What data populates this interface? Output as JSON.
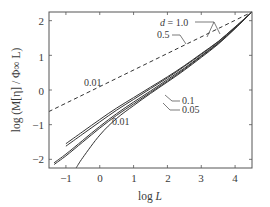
{
  "chart_data": {
    "type": "line",
    "title": "",
    "xlabel": "log L",
    "ylabel": "log (M[η] / Φ∞ L)",
    "xlim": [
      -1.5,
      4.5
    ],
    "ylim": [
      -2.25,
      2.25
    ],
    "xticks": [
      "-1",
      "0",
      "1",
      "2",
      "3",
      "4"
    ],
    "yticks": [
      "2",
      "1",
      "0",
      "-1",
      "-2"
    ],
    "grid": false,
    "legend": "inline annotations",
    "series": [
      {
        "name": "d = 1.0",
        "style": "solid",
        "x": [
          -1.0,
          -0.5,
          0,
          0.5,
          1,
          1.5,
          2,
          2.5,
          3,
          3.5,
          4,
          4.5
        ],
        "y": [
          -1.55,
          -1.2,
          -0.85,
          -0.52,
          -0.22,
          0.08,
          0.38,
          0.7,
          1.05,
          1.4,
          1.82,
          2.25
        ]
      },
      {
        "name": "0.5",
        "style": "solid",
        "x": [
          -1.0,
          -0.5,
          0,
          0.5,
          1,
          1.5,
          2,
          2.5,
          3,
          3.5,
          4,
          4.5
        ],
        "y": [
          -1.62,
          -1.27,
          -0.92,
          -0.58,
          -0.27,
          0.04,
          0.35,
          0.68,
          1.03,
          1.39,
          1.81,
          2.25
        ]
      },
      {
        "name": "0.1",
        "style": "solid",
        "x": [
          -1.35,
          -1,
          -0.5,
          0,
          0.5,
          1,
          1.5,
          2,
          2.5,
          3,
          3.5,
          4,
          4.5
        ],
        "y": [
          -2.1,
          -1.85,
          -1.45,
          -1.05,
          -0.68,
          -0.35,
          -0.03,
          0.3,
          0.63,
          0.99,
          1.36,
          1.79,
          2.25
        ]
      },
      {
        "name": "0.05",
        "style": "solid",
        "x": [
          -1.35,
          -1,
          -0.5,
          0,
          0.5,
          1,
          1.5,
          2,
          2.5,
          3,
          3.5,
          4,
          4.5
        ],
        "y": [
          -2.15,
          -1.9,
          -1.5,
          -1.1,
          -0.73,
          -0.4,
          -0.07,
          0.26,
          0.6,
          0.97,
          1.34,
          1.78,
          2.25
        ]
      },
      {
        "name": "0.01",
        "style": "solid",
        "x": [
          -0.7,
          -0.5,
          0,
          0.5,
          1,
          1.5,
          2,
          2.5,
          3,
          3.5,
          4,
          4.5
        ],
        "y": [
          -2.25,
          -1.95,
          -1.3,
          -0.82,
          -0.45,
          -0.1,
          0.23,
          0.57,
          0.94,
          1.32,
          1.77,
          2.25
        ]
      },
      {
        "name": "0.01 (dashed)",
        "style": "dashed",
        "x": [
          -1.5,
          4.5
        ],
        "y": [
          -0.62,
          2.25
        ]
      }
    ],
    "annotations": [
      {
        "text": "d = 1.0",
        "x": 2.2,
        "y": 1.7
      },
      {
        "text": "0.5",
        "x": 2.2,
        "y": 1.4
      },
      {
        "text": "0.01",
        "x": 0.1,
        "y": 0.1
      },
      {
        "text": "0.1",
        "x": 1.55,
        "y": -0.35
      },
      {
        "text": "0.05",
        "x": 1.55,
        "y": -0.6
      },
      {
        "text": "0.01",
        "x": 0.95,
        "y": -0.85
      }
    ]
  },
  "labels": {
    "xlabel_pre": "log ",
    "xlabel_var": "L",
    "ylabel": "log (M[η] / Φ∞ L)",
    "ann_d": "d",
    "ann_d_val": " = 1.0",
    "ann_05": "0.5",
    "ann_001_dash": "0.01",
    "ann_01": "0.1",
    "ann_005": "0.05",
    "ann_001": "0.01",
    "xt": [
      "−1",
      "0",
      "1",
      "2",
      "3",
      "4"
    ],
    "yt": [
      "2",
      "1",
      "0",
      "−1",
      "−2"
    ]
  }
}
